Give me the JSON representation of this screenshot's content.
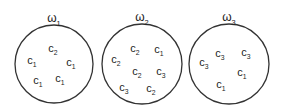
{
  "clusters": [
    {
      "label": "ω",
      "sub": "1",
      "cx": 54,
      "cy": 64,
      "r": 39,
      "lx": 54,
      "ly": 18,
      "items": [
        {
          "t": "c",
          "s": "2",
          "x": 55,
          "y": 48
        },
        {
          "t": "c",
          "s": "1",
          "x": 34,
          "y": 60
        },
        {
          "t": "c",
          "s": "1",
          "x": 73,
          "y": 62
        },
        {
          "t": "c",
          "s": "1",
          "x": 40,
          "y": 80
        },
        {
          "t": "c",
          "s": "1",
          "x": 62,
          "y": 78
        }
      ]
    },
    {
      "label": "ω",
      "sub": "2",
      "cx": 142,
      "cy": 64,
      "r": 40,
      "lx": 142,
      "ly": 17,
      "items": [
        {
          "t": "c",
          "s": "2",
          "x": 137,
          "y": 48
        },
        {
          "t": "c",
          "s": "1",
          "x": 161,
          "y": 49
        },
        {
          "t": "c",
          "s": "2",
          "x": 118,
          "y": 59
        },
        {
          "t": "c",
          "s": "2",
          "x": 139,
          "y": 71
        },
        {
          "t": "c",
          "s": "3",
          "x": 163,
          "y": 71
        },
        {
          "t": "c",
          "s": "3",
          "x": 126,
          "y": 87
        },
        {
          "t": "c",
          "s": "2",
          "x": 153,
          "y": 88
        }
      ]
    },
    {
      "label": "ω",
      "sub": "3",
      "cx": 229,
      "cy": 64,
      "r": 40,
      "lx": 229,
      "ly": 17,
      "items": [
        {
          "t": "c",
          "s": "3",
          "x": 222,
          "y": 53
        },
        {
          "t": "c",
          "s": "3",
          "x": 248,
          "y": 52
        },
        {
          "t": "c",
          "s": "3",
          "x": 206,
          "y": 62
        },
        {
          "t": "c",
          "s": "1",
          "x": 244,
          "y": 72
        },
        {
          "t": "c",
          "s": "1",
          "x": 223,
          "y": 84
        }
      ]
    }
  ],
  "colors": {
    "stroke": "#333333",
    "text": "#222222"
  }
}
